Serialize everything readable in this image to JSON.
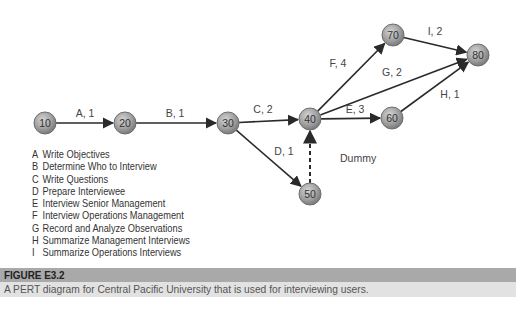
{
  "diagram": {
    "type": "pert",
    "nodes": [
      {
        "id": "10",
        "x": 45,
        "y": 123
      },
      {
        "id": "20",
        "x": 125,
        "y": 123
      },
      {
        "id": "30",
        "x": 228,
        "y": 123
      },
      {
        "id": "40",
        "x": 310,
        "y": 119
      },
      {
        "id": "50",
        "x": 310,
        "y": 194
      },
      {
        "id": "60",
        "x": 392,
        "y": 118
      },
      {
        "id": "70",
        "x": 393,
        "y": 35
      },
      {
        "id": "80",
        "x": 478,
        "y": 55
      }
    ],
    "edges": [
      {
        "from": "10",
        "to": "20",
        "label": "A, 1",
        "lx": 85,
        "ly": 117
      },
      {
        "from": "20",
        "to": "30",
        "label": "B, 1",
        "lx": 175,
        "ly": 117
      },
      {
        "from": "30",
        "to": "40",
        "label": "C, 2",
        "lx": 263,
        "ly": 113
      },
      {
        "from": "30",
        "to": "50",
        "label": "D, 1",
        "lx": 284,
        "ly": 155
      },
      {
        "from": "40",
        "to": "60",
        "label": "E, 3",
        "lx": 355,
        "ly": 113
      },
      {
        "from": "40",
        "to": "70",
        "label": "F, 4",
        "lx": 338,
        "ly": 67
      },
      {
        "from": "40",
        "to": "80",
        "label": "G, 2",
        "lx": 392,
        "ly": 76
      },
      {
        "from": "60",
        "to": "80",
        "label": "H, 1",
        "lx": 450,
        "ly": 98
      },
      {
        "from": "70",
        "to": "80",
        "label": "I, 2",
        "lx": 435,
        "ly": 35
      },
      {
        "from": "50",
        "to": "40",
        "label": "Dummy",
        "lx": 340,
        "ly": 162,
        "dashed": true
      }
    ],
    "colors": {
      "node_fill": "#9a9a9a",
      "node_stroke": "#6e6e6e",
      "edge": "#2a2a2a",
      "label": "#444444"
    }
  },
  "legend": [
    {
      "letter": "A",
      "text": "Write Objectives"
    },
    {
      "letter": "B",
      "text": "Determine Who to Interview"
    },
    {
      "letter": "C",
      "text": "Write Questions"
    },
    {
      "letter": "D",
      "text": "Prepare Interviewee"
    },
    {
      "letter": "E",
      "text": "Interview Senior Management"
    },
    {
      "letter": "F",
      "text": "Interview Operations Management"
    },
    {
      "letter": "G",
      "text": "Record and Analyze Observations"
    },
    {
      "letter": "H",
      "text": "Summarize Management Interviews"
    },
    {
      "letter": "I",
      "text": "Summarize Operations Interviews"
    }
  ],
  "caption": {
    "title": "FIGURE E3.2",
    "text": "A PERT diagram for Central Pacific University that is used for interviewing users."
  }
}
